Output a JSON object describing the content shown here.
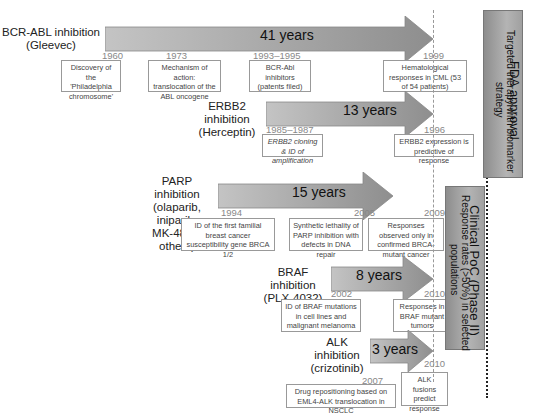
{
  "diagram": {
    "type": "timeline",
    "tracks": [
      {
        "label_line1": "BCR-ABL inhibition",
        "label_line2": "(Gleevec)",
        "duration": "41 years",
        "milestones": [
          {
            "year": "1960",
            "text": "Discovery of the 'Philadelphia chromosome'"
          },
          {
            "year": "1973",
            "text": "Mechanism of action: translocation of the ABL oncogene"
          },
          {
            "year": "1993–1995",
            "text": "BCR-Abl inhibitors (patents filed)"
          },
          {
            "year": "1999",
            "text": "Hematological responses in CML (53 of 54 patients)"
          }
        ],
        "end_year": "2001"
      },
      {
        "label_line1": "ERBB2 inhibition",
        "label_line2": "(Herceptin)",
        "duration": "13 years",
        "milestones": [
          {
            "year": "1985–1987",
            "text": "ERBB2 cloning & ID of amplification"
          },
          {
            "year": "1996",
            "text": "ERBB2 expression is predictive of response"
          }
        ],
        "end_year": "1998"
      },
      {
        "label_line1": "PARP inhibition",
        "label_line2": "(olaparib, iniparib,",
        "label_line3": "MK-4827, others)",
        "duration": "15 years",
        "milestones": [
          {
            "year": "1994",
            "text": "ID of the first familial breast cancer susceptibility gene BRCA 1/2"
          },
          {
            "year": "2005",
            "text": "Synthetic lethality of PARP inhibition with defects in DNA repair"
          },
          {
            "year": "",
            "text": "Responses observed only in confirmed BRCA-mutant cancer"
          }
        ],
        "end_year": "2009"
      },
      {
        "label_line1": "BRAF inhibition",
        "label_line2": "(PLX-4032)",
        "duration": "8 years",
        "milestones": [
          {
            "year": "2002",
            "text": "ID of BRAF mutations in cell lines and malignant melanoma"
          },
          {
            "year": "",
            "text": "Responses in BRAF mutant tumors"
          }
        ],
        "end_year": "2010"
      },
      {
        "label_line1": "ALK inhibition",
        "label_line2": "(crizotinib)",
        "duration": "3 years",
        "milestones": [
          {
            "year": "2007",
            "text": "Drug repositioning based on EML4-ALK translocation in NSCLC"
          },
          {
            "year": "",
            "text": "ALK fusions predict response"
          }
        ],
        "end_year": "2010"
      }
    ],
    "fda_box": {
      "title": "FDA approval",
      "subtitle_line1": "Targeted therapy with biomarker",
      "subtitle_line2": "strategy"
    },
    "poc_box": {
      "title": "Clinical PoC (Phase II)",
      "subtitle_line1": "Response rates (>50%) in selected",
      "subtitle_line2": "populations"
    },
    "colors": {
      "arrow_fill_start": "#b8b8b8",
      "arrow_fill_end": "#8a8a8a",
      "box_border": "#999999",
      "year_text": "#888888"
    }
  }
}
